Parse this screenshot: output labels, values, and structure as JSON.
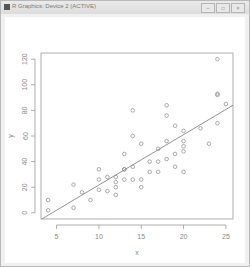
{
  "window": {
    "title": "R Graphics: Device 2 (ACTIVE)",
    "buttons": [
      {
        "name": "minimize",
        "glyph": "–"
      },
      {
        "name": "maximize",
        "glyph": "□"
      },
      {
        "name": "close",
        "glyph": "×"
      }
    ]
  },
  "chart_data": {
    "type": "scatter",
    "title": "",
    "xlabel": "x",
    "ylabel": "y",
    "xlim": [
      4,
      25
    ],
    "ylim": [
      0,
      120
    ],
    "xticks": [
      5,
      10,
      15,
      20,
      25
    ],
    "yticks": [
      0,
      20,
      40,
      60,
      80,
      100,
      120
    ],
    "grid": false,
    "points": [
      [
        4,
        2
      ],
      [
        4,
        10
      ],
      [
        7,
        4
      ],
      [
        7,
        22
      ],
      [
        8,
        16
      ],
      [
        9,
        10
      ],
      [
        10,
        18
      ],
      [
        10,
        26
      ],
      [
        10,
        34
      ],
      [
        11,
        17
      ],
      [
        11,
        28
      ],
      [
        12,
        14
      ],
      [
        12,
        20
      ],
      [
        12,
        24
      ],
      [
        12,
        28
      ],
      [
        13,
        26
      ],
      [
        13,
        34
      ],
      [
        13,
        34
      ],
      [
        13,
        46
      ],
      [
        14,
        26
      ],
      [
        14,
        36
      ],
      [
        14,
        60
      ],
      [
        14,
        80
      ],
      [
        15,
        20
      ],
      [
        15,
        26
      ],
      [
        15,
        54
      ],
      [
        16,
        32
      ],
      [
        16,
        40
      ],
      [
        17,
        32
      ],
      [
        17,
        40
      ],
      [
        17,
        50
      ],
      [
        18,
        42
      ],
      [
        18,
        56
      ],
      [
        18,
        76
      ],
      [
        18,
        84
      ],
      [
        19,
        36
      ],
      [
        19,
        46
      ],
      [
        19,
        68
      ],
      [
        20,
        32
      ],
      [
        20,
        48
      ],
      [
        20,
        52
      ],
      [
        20,
        56
      ],
      [
        20,
        64
      ],
      [
        22,
        66
      ],
      [
        23,
        54
      ],
      [
        24,
        70
      ],
      [
        24,
        92
      ],
      [
        24,
        93
      ],
      [
        24,
        120
      ],
      [
        25,
        85
      ]
    ],
    "regression_line": {
      "intercept": -17.579,
      "slope": 3.932
    }
  }
}
